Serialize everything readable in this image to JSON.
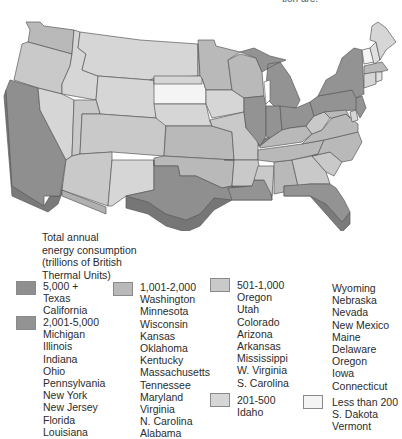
{
  "top_caption": "tion are.",
  "legend": {
    "title_lines": [
      "Total annual",
      "energy consumption",
      "(trillions of British",
      "Thermal Units)"
    ],
    "categories": [
      {
        "range": "5,000 +",
        "color": "#8f8f8f",
        "states": [
          "Texas",
          "California"
        ]
      },
      {
        "range": "2,001-5,000",
        "color": "#939393",
        "states": [
          "Michigan",
          "Illinois",
          "Indiana",
          "Ohio",
          "Pennsylvania",
          "New York",
          "New Jersey",
          "Florida",
          "Louisiana"
        ]
      },
      {
        "range": "1,001-2,000",
        "color": "#b9b9b9",
        "states": [
          "Washington",
          "Minnesota",
          "Wisconsin",
          "Kansas",
          "Oklahoma",
          "Kentucky",
          "Massachusetts",
          "Tennessee",
          "Maryland",
          "Virginia",
          "N. Carolina",
          "Alabama"
        ]
      },
      {
        "range": "501-1,000",
        "color": "#c9c9c9",
        "states": [
          "Oregon",
          "Utah",
          "Colorado",
          "Arizona",
          "Arkansas",
          "Mississippi",
          "W. Virginia",
          "S. Carolina"
        ]
      },
      {
        "range": "201-500",
        "color": "#d6d6d6",
        "states": [
          "Idaho",
          "Wyoming",
          "Nebraska",
          "Nevada",
          "New Mexico",
          "Maine",
          "Delaware",
          "Oregon",
          "Iowa",
          "Connecticut"
        ]
      },
      {
        "range": "Less than 200",
        "color": "#f4f4f4",
        "states": [
          "S. Dakota",
          "Vermont"
        ]
      }
    ]
  },
  "map_colors": {
    "tier_5000_plus": "#8f8f8f",
    "tier_2001_5000": "#939393",
    "tier_1001_2000": "#b9b9b9",
    "tier_501_1000": "#c9c9c9",
    "tier_201_500": "#d6d6d6",
    "tier_under_200": "#f4f4f4",
    "outline": "#5a5a5a"
  }
}
